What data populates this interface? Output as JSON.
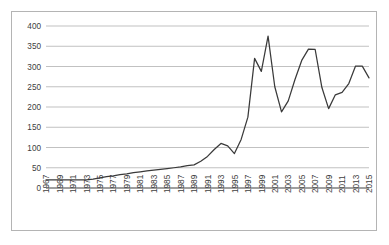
{
  "card": {
    "border_color": "#b4b4b4",
    "background": "#ffffff"
  },
  "chart_data": {
    "type": "line",
    "title": "",
    "subtitle": "",
    "xlabel": "",
    "ylabel": "",
    "grid": true,
    "legend": "none",
    "line_color": "#3a3a3a",
    "gridline_color": "#a6a6a6",
    "axis_color": "#7f7f7f",
    "ylim": [
      0,
      400
    ],
    "yticks": [
      0,
      50,
      100,
      150,
      200,
      250,
      300,
      350,
      400
    ],
    "ytick_labels": [
      "0",
      "50",
      "100",
      "150",
      "200",
      "250",
      "300",
      "350",
      "400"
    ],
    "xlim": [
      1967,
      2015
    ],
    "xticks": [
      1967,
      1969,
      1971,
      1973,
      1975,
      1977,
      1979,
      1981,
      1983,
      1985,
      1987,
      1989,
      1991,
      1993,
      1995,
      1997,
      1999,
      2001,
      2003,
      2005,
      2007,
      2009,
      2011,
      2013,
      2015
    ],
    "xtick_labels": [
      "1967",
      "1969",
      "1971",
      "1973",
      "1975",
      "1977",
      "1979",
      "1981",
      "1983",
      "1985",
      "1987",
      "1989",
      "1991",
      "1993",
      "1995",
      "1997",
      "1999",
      "2001",
      "2003",
      "2005",
      "2007",
      "2009",
      "2011",
      "2013",
      "2015"
    ],
    "xtick_rotation": -90,
    "x": [
      1967,
      1968,
      1969,
      1970,
      1971,
      1972,
      1973,
      1974,
      1975,
      1976,
      1977,
      1978,
      1979,
      1980,
      1981,
      1982,
      1983,
      1984,
      1985,
      1986,
      1987,
      1988,
      1989,
      1990,
      1991,
      1992,
      1993,
      1994,
      1995,
      1996,
      1997,
      1998,
      1999,
      2000,
      2001,
      2002,
      2003,
      2004,
      2005,
      2006,
      2007,
      2008,
      2009,
      2010,
      2011,
      2012,
      2013,
      2014,
      2015
    ],
    "series": [
      {
        "name": "series-1",
        "values": [
          20,
          20,
          20,
          20,
          20,
          20,
          20,
          22,
          25,
          28,
          30,
          33,
          35,
          38,
          40,
          42,
          44,
          46,
          48,
          50,
          52,
          55,
          57,
          66,
          78,
          95,
          110,
          104,
          85,
          120,
          175,
          320,
          288,
          375,
          250,
          188,
          215,
          268,
          315,
          343,
          342,
          248,
          196,
          230,
          236,
          258,
          301,
          301,
          272
        ]
      }
    ]
  }
}
